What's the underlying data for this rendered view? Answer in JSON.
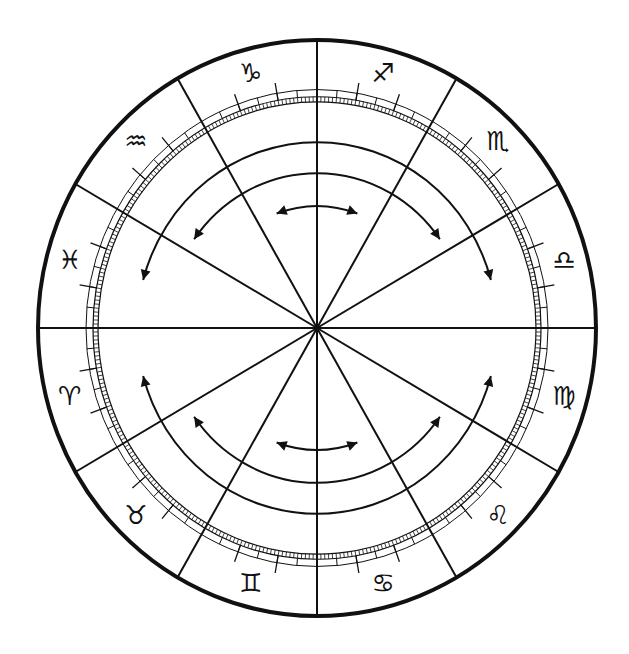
{
  "diagram": {
    "title": "",
    "type": "zodiac-house-wheel",
    "colors": {
      "ink": "#111111",
      "background": "#ffffff"
    },
    "houses": 12,
    "house_line_angles_deg": [
      0,
      30,
      60,
      90,
      120,
      150,
      180,
      210,
      240,
      270,
      300,
      330
    ],
    "signs": [
      {
        "name": "capricorn",
        "glyph": "♑",
        "angle_deg": 105
      },
      {
        "name": "sagittarius",
        "glyph": "♐",
        "angle_deg": 75
      },
      {
        "name": "scorpio",
        "glyph": "♏",
        "angle_deg": 45
      },
      {
        "name": "libra",
        "glyph": "♎",
        "angle_deg": 15
      },
      {
        "name": "virgo",
        "glyph": "♍",
        "angle_deg": -15
      },
      {
        "name": "leo",
        "glyph": "♌",
        "angle_deg": -45
      },
      {
        "name": "cancer",
        "glyph": "♋",
        "angle_deg": -75
      },
      {
        "name": "gemini",
        "glyph": "♊",
        "angle_deg": -105
      },
      {
        "name": "taurus",
        "glyph": "♉",
        "angle_deg": -135
      },
      {
        "name": "aries",
        "glyph": "♈",
        "angle_deg": -165
      },
      {
        "name": "pisces",
        "glyph": "♓",
        "angle_deg": 165
      },
      {
        "name": "aquarius",
        "glyph": "♒",
        "angle_deg": 135
      }
    ],
    "arrows": [
      {
        "name": "upper-inner-arrow",
        "radius": 118,
        "from_deg": 70,
        "to_deg": 110,
        "half": "upper"
      },
      {
        "name": "upper-middle-arrow",
        "radius": 150,
        "from_deg": 35,
        "to_deg": 145,
        "half": "upper"
      },
      {
        "name": "upper-outer-arrow",
        "radius": 180,
        "from_deg": 15,
        "to_deg": 165,
        "half": "upper"
      },
      {
        "name": "lower-inner-arrow",
        "radius": 118,
        "from_deg": 70,
        "to_deg": 110,
        "half": "lower"
      },
      {
        "name": "lower-middle-arrow",
        "radius": 150,
        "from_deg": 35,
        "to_deg": 145,
        "half": "lower"
      },
      {
        "name": "lower-outer-arrow",
        "radius": 180,
        "from_deg": 15,
        "to_deg": 165,
        "half": "lower"
      }
    ]
  }
}
